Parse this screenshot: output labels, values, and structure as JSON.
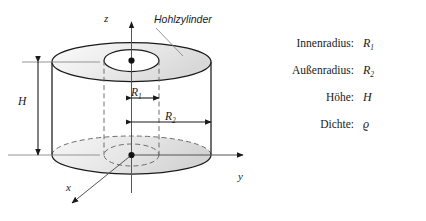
{
  "figure": {
    "title_callout": "Hohlzylinder",
    "axes": [
      {
        "name": "z-axis",
        "label": "z"
      },
      {
        "name": "y-axis",
        "label": "y"
      },
      {
        "name": "x-axis",
        "label": "x"
      }
    ],
    "dimensions": [
      {
        "name": "height-dimension",
        "label": "H"
      },
      {
        "name": "inner-radius-dimension",
        "symbol": "R",
        "sub": "1"
      },
      {
        "name": "outer-radius-dimension",
        "symbol": "R",
        "sub": "2"
      }
    ],
    "colors": {
      "outline": "#1a1a1a",
      "shade_light": "#f2f2f2",
      "shade_mid": "#dcdcdc",
      "dashed": "#6e6e6e",
      "background": "#ffffff"
    }
  },
  "legend": {
    "rows": [
      {
        "term": "Innenradius:",
        "symbol": "R",
        "sub": "1"
      },
      {
        "term": "Außenradius:",
        "symbol": "R",
        "sub": "2"
      },
      {
        "term": "Höhe:",
        "symbol": "H",
        "sub": ""
      },
      {
        "term": "Dichte:",
        "symbol": "ϱ",
        "sub": ""
      }
    ]
  }
}
